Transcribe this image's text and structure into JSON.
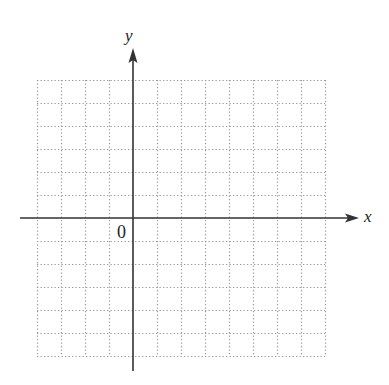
{
  "diagram": {
    "type": "coordinate-plane",
    "x_axis_label": "x",
    "y_axis_label": "y",
    "origin_label": "0",
    "grid": {
      "columns": 12,
      "rows": 12,
      "columns_left_of_y_axis": 4,
      "columns_right_of_y_axis": 8,
      "rows_above_x_axis": 6,
      "rows_below_x_axis": 6,
      "line_style": "dotted"
    },
    "colors": {
      "axis": "#333333",
      "grid": "#9a9a9a",
      "background": "#ffffff"
    }
  }
}
